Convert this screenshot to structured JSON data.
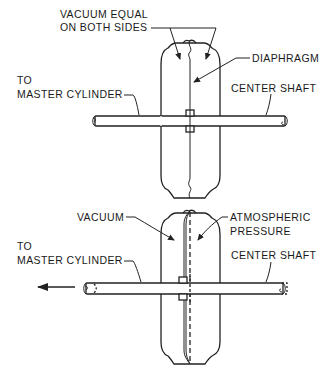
{
  "diagram": {
    "type": "technical-illustration",
    "top_view": {
      "state": "released / equal vacuum",
      "labels": {
        "vacuum_equal_line1": "VACUUM EQUAL",
        "vacuum_equal_line2": "ON BOTH SIDES",
        "diaphragm": "DIAPHRAGM",
        "to_line1": "TO",
        "master_cylinder": "MASTER CYLINDER",
        "center_shaft": "CENTER SHAFT"
      }
    },
    "bottom_view": {
      "state": "applied / pressure differential",
      "labels": {
        "vacuum": "VACUUM",
        "atmospheric_line1": "ATMOSPHERIC",
        "atmospheric_line2": "PRESSURE",
        "to_line1": "TO",
        "master_cylinder": "MASTER CYLINDER",
        "center_shaft": "CENTER SHAFT"
      },
      "motion_arrow_direction": "left"
    },
    "colors": {
      "line": "#222222",
      "background": "#ffffff"
    }
  }
}
